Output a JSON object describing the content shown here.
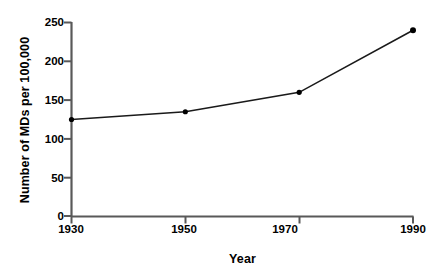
{
  "chart_data": {
    "type": "line",
    "title": "",
    "xlabel": "Year",
    "ylabel": "Number of MDs per 100,000",
    "x": [
      1930,
      1950,
      1970,
      1990
    ],
    "values": [
      125,
      135,
      160,
      240
    ],
    "categories": [
      "1930",
      "1950",
      "1970",
      "1990"
    ],
    "xlim": [
      1930,
      1990
    ],
    "ylim": [
      0,
      250
    ],
    "xticks": [
      "1930",
      "1950",
      "1970",
      "1990"
    ],
    "yticks": [
      "0",
      "50",
      "100",
      "150",
      "200",
      "250"
    ],
    "grid": false,
    "legend": false,
    "series": [
      {
        "name": "Number of MDs per 100,000",
        "values": [
          125,
          135,
          160,
          240
        ]
      }
    ],
    "marker": "filled-circle",
    "line_color": "#1a1a1a",
    "marker_color": "#000000",
    "axis_color": "#595959",
    "background": "#ffffff"
  },
  "axes": {
    "y_title": "Number of MDs per 100,000",
    "x_title": "Year",
    "y_tick_labels": [
      "250",
      "200",
      "150",
      "100",
      "50",
      "0"
    ],
    "x_tick_labels": [
      "1930",
      "1950",
      "1970",
      "1990"
    ]
  }
}
